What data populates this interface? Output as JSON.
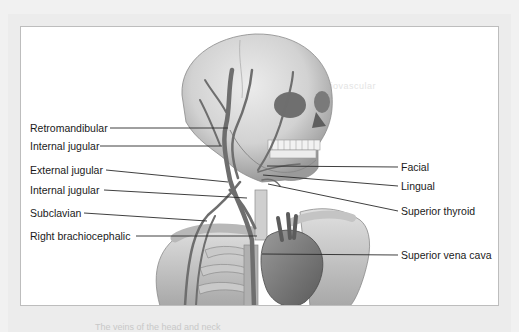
{
  "figure": {
    "title": "Veins of the head and neck",
    "caption_partial": "The veins of the head and neck",
    "colors": {
      "page_margin": "#ececec",
      "frame_border": "#bdbdbd",
      "bone": "#d9d9d9",
      "bone_shadow": "#8f8f8f",
      "vein": "#6e6e6e",
      "leader_line": "#2a2a2a",
      "label_text": "#1a1a1a"
    },
    "labels_left": [
      {
        "text": "Retromandibular",
        "x": 30,
        "y": 123,
        "line_start_x": 110,
        "line_end_x": 228,
        "line_end_y": 128
      },
      {
        "text": "Internal jugular",
        "x": 30,
        "y": 141,
        "line_start_x": 100,
        "line_end_x": 222,
        "line_end_y": 146
      },
      {
        "text": "External jugular",
        "x": 30,
        "y": 164,
        "line_start_x": 106,
        "line_end_x": 228,
        "line_end_y": 182
      },
      {
        "text": "Internal jugular",
        "x": 30,
        "y": 185,
        "line_start_x": 104,
        "line_end_x": 247,
        "line_end_y": 198
      },
      {
        "text": "Subclavian",
        "x": 30,
        "y": 207,
        "line_start_x": 84,
        "line_end_x": 207,
        "line_end_y": 221
      },
      {
        "text": "Right brachiocephalic",
        "x": 30,
        "y": 230,
        "line_start_x": 136,
        "line_end_x": 257,
        "line_end_y": 236
      }
    ],
    "labels_right": [
      {
        "text": "Facial",
        "x": 401,
        "y": 161,
        "line_start_x": 398,
        "line_end_x": 267,
        "line_end_y": 166
      },
      {
        "text": "Lingual",
        "x": 401,
        "y": 181,
        "line_start_x": 398,
        "line_end_x": 263,
        "line_end_y": 175
      },
      {
        "text": "Superior thyroid",
        "x": 401,
        "y": 206,
        "line_start_x": 398,
        "line_end_x": 268,
        "line_end_y": 184
      },
      {
        "text": "Superior vena cava",
        "x": 401,
        "y": 249,
        "line_start_x": 398,
        "line_end_x": 262,
        "line_end_y": 254
      }
    ]
  }
}
